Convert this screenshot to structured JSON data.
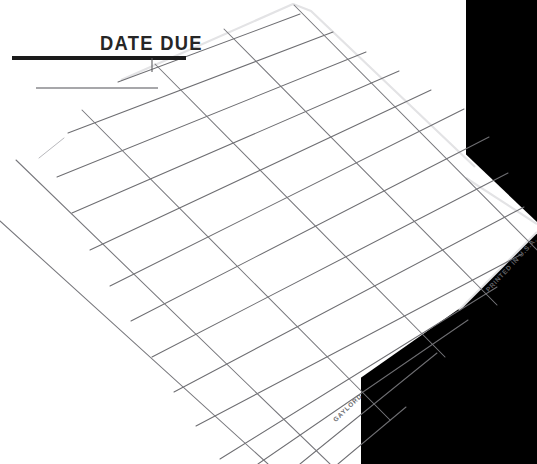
{
  "document": {
    "kind": "library-date-due-slip",
    "orientation_degrees": -45,
    "background_color": "#ffffff",
    "black_region_color": "#000000",
    "paper_color": "#ffffff",
    "rule_line_color": "#6e6e72",
    "heading_rule_color": "#1b1b1b"
  },
  "labels": {
    "heading": "DATE DUE",
    "publisher_mark": "GAYLORD",
    "origin_mark": "PRINTED IN U.S.A."
  },
  "geometry": {
    "canvas_width": 537,
    "canvas_height": 464,
    "ruling_angle_primary_degrees": -44,
    "ruling_angle_secondary_degrees": 47,
    "ruling_count_primary": 14,
    "ruling_count_secondary": 6,
    "heading_rule_thick": {
      "x1": 12,
      "y1": 58,
      "x2": 186,
      "y2": 58
    },
    "heading_rule_thin": {
      "x1": 36,
      "y1": 88,
      "x2": 158,
      "y2": 88
    }
  }
}
